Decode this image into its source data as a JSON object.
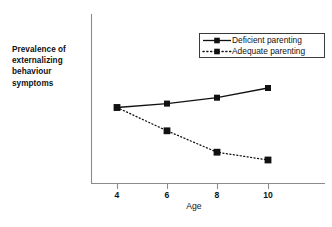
{
  "chart_data": {
    "type": "line",
    "title": "",
    "xlabel": "Age",
    "ylabel": "Prevalence of externalizing behaviour symptoms",
    "x": [
      4,
      6,
      8,
      10
    ],
    "xtick_labels": [
      "4",
      "6",
      "8",
      "10"
    ],
    "ytick_labels": [],
    "xlim": [
      3,
      12.6
    ],
    "ylim": [
      0,
      100
    ],
    "grid": false,
    "legend_position": "top-right",
    "series": [
      {
        "name": "Deficient parenting",
        "values": [
          43,
          45,
          48,
          53
        ],
        "linestyle": "solid",
        "marker": "square",
        "color": "#111111"
      },
      {
        "name": "Adequate parenting",
        "values": [
          43,
          31,
          20,
          16
        ],
        "linestyle": "dotted",
        "marker": "square",
        "color": "#111111"
      }
    ],
    "annotations": [
      "Both series share the same value at age 4"
    ]
  },
  "axes": {
    "y_title_lines": "Prevalence of\nexternalizing\nbehaviour\nsymptoms",
    "x_title": "Age"
  },
  "legend": {
    "entries": [
      {
        "label": "Deficient parenting",
        "style": "solid-line-square-marker"
      },
      {
        "label": "Adequate parenting",
        "style": "dotted-line-square-marker"
      }
    ]
  },
  "xticks": [
    {
      "label": "4",
      "px": 117
    },
    {
      "label": "6",
      "px": 167
    },
    {
      "label": "8",
      "px": 217
    },
    {
      "label": "10",
      "px": 268
    }
  ],
  "colors": {
    "background": "#ffffff",
    "axis": "#8c8c8c",
    "series": "#111111",
    "text": "#111111",
    "legend_border": "#3a3a3a"
  }
}
